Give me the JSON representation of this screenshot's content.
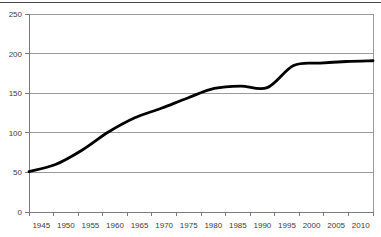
{
  "chart_data": {
    "type": "line",
    "title": "",
    "subtitle": "",
    "xlabel": "",
    "ylabel": "",
    "xlim": [
      1945,
      2010
    ],
    "ylim": [
      0,
      250
    ],
    "ytick_values": [
      0,
      50,
      100,
      150,
      200,
      250
    ],
    "ytick_labels": [
      "0",
      "50",
      "100",
      "150",
      "200",
      "250"
    ],
    "xtick_labels": [
      "1945",
      "1950",
      "1955",
      "1960",
      "1965",
      "1970",
      "1975",
      "1980",
      "1985",
      "1990",
      "1995",
      "2000",
      "2005",
      "2010"
    ],
    "x": [
      1945,
      1950,
      1955,
      1960,
      1965,
      1970,
      1975,
      1980,
      1985,
      1990,
      1995,
      2000,
      2005,
      2010
    ],
    "values": [
      51,
      60,
      78,
      101,
      119,
      131,
      144,
      156,
      159,
      157,
      185,
      188,
      190,
      191
    ],
    "series": [
      {
        "name": "series-1",
        "values": [
          51,
          60,
          78,
          101,
          119,
          131,
          144,
          156,
          159,
          157,
          185,
          188,
          190,
          191
        ]
      }
    ],
    "grid": true,
    "grid_axis": "y",
    "legend": false,
    "legend_position": "none",
    "line_color": "#000000",
    "grid_color": "#9a9a9a",
    "axis_color": "#7b7b7b",
    "plot_background": "#ffffff",
    "annotations": []
  },
  "colors": {
    "line": "#000000",
    "grid": "#9a9a9a",
    "axis": "#7b7b7b",
    "text": "#3c3c3c",
    "background": "#ffffff",
    "top_rule": "#4a4a4a"
  }
}
